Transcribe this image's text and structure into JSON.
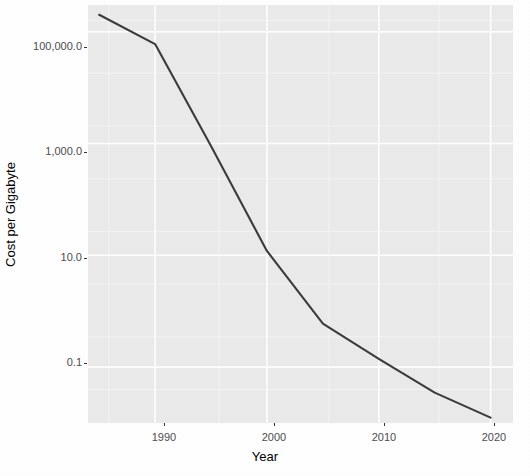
{
  "chart_data": {
    "type": "line",
    "title": "",
    "subtitle": "",
    "xlabel": "Year",
    "ylabel": "Cost per Gigabyte",
    "xlim": [
      1984,
      2022
    ],
    "ylim": [
      0.01,
      300000
    ],
    "yscale": "log",
    "xscale": "linear",
    "grid": true,
    "legend": null,
    "legend_position": "none",
    "xticks": [
      1990,
      2000,
      2010,
      2020
    ],
    "xticklabels": [
      "1990",
      "2000",
      "2010",
      "2020"
    ],
    "yticks": [
      0.1,
      10.0,
      1000.0,
      100000.0
    ],
    "yticklabels": [
      "0.1",
      "10.0",
      "1,000.0",
      "100,000.0"
    ],
    "series": [
      {
        "name": "Cost per Gigabyte",
        "color": "#3b3b3b",
        "x": [
          1985,
          1990,
          1995,
          2000,
          2005,
          2010,
          2015,
          2020
        ],
        "y": [
          200000,
          60000,
          900,
          12,
          0.6,
          0.14,
          0.035,
          0.0125
        ]
      }
    ],
    "annotations": []
  },
  "axes": {
    "y_title": "Cost per Gigabyte",
    "x_title": "Year",
    "y_ticks": [
      {
        "label": "100,000.0",
        "value": 100000.0
      },
      {
        "label": "1,000.0",
        "value": 1000.0
      },
      {
        "label": "10.0",
        "value": 10.0
      },
      {
        "label": "0.1",
        "value": 0.1
      }
    ],
    "x_ticks": [
      {
        "label": "1990",
        "value": 1990
      },
      {
        "label": "2000",
        "value": 2000
      },
      {
        "label": "2010",
        "value": 2010
      },
      {
        "label": "2020",
        "value": 2020
      }
    ]
  },
  "style": {
    "panel_background": "#ebebeb",
    "figure_background": "#ffffff",
    "major_grid_color": "#ffffff",
    "minor_grid_color": "#f5f5f5",
    "line_color": "#3b3b3b",
    "tick_text_color": "#4d4d4d",
    "title_text_color": "#000000"
  }
}
